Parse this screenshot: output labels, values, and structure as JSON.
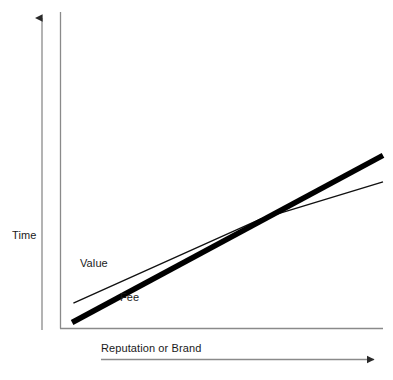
{
  "chart_data": {
    "type": "line",
    "title": "",
    "subtitle": "",
    "xlabel": "Reputation or Brand",
    "ylabel": "Time",
    "xlim": [
      0,
      100
    ],
    "ylim": [
      0,
      100
    ],
    "grid": false,
    "legend_position": "inline-annotation",
    "axes_style": "qualitative-arrows-no-ticks",
    "xticks": [],
    "yticks": [],
    "annotations": [
      {
        "text": "Value",
        "x": 3.4,
        "y": 23.5
      },
      {
        "text": "Fee",
        "x": 16.2,
        "y": 12.0
      },
      {
        "text": "Time",
        "x": -20.0,
        "y": 31.5
      },
      {
        "text": "Reputation or Brand",
        "x": 8.0,
        "y": -6.0
      }
    ],
    "series": [
      {
        "name": "Value",
        "style": "thin",
        "stroke": "#111111",
        "width_px": 1.4,
        "points": [
          {
            "x": 4.0,
            "y": 10.5
          },
          {
            "x": 62.0,
            "y": 45.5
          },
          {
            "x": 100.0,
            "y": 61.0
          }
        ]
      },
      {
        "name": "Fee",
        "style": "thick",
        "stroke": "#000000",
        "width_px": 5.5,
        "points": [
          {
            "x": 3.6,
            "y": 2.5
          },
          {
            "x": 100.0,
            "y": 72.0
          }
        ]
      }
    ],
    "crossing_point": {
      "x": 66.0,
      "y": 48.0
    },
    "colors": {
      "axis": "#8a8a8a",
      "value_line": "#111111",
      "fee_line": "#000000",
      "text": "#1a1a1a",
      "background": "#ffffff"
    }
  },
  "labels": {
    "y_axis": "Time",
    "x_axis": "Reputation or Brand",
    "value_series": "Value",
    "fee_series": "Fee"
  }
}
